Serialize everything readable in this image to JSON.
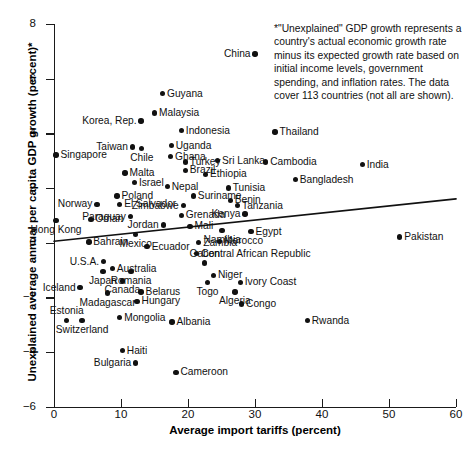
{
  "chart_data": {
    "type": "scatter",
    "title": "",
    "xlabel": "Average import tariffs (percent)",
    "ylabel": "Unexplained average annual per capita GDP growth (percent)*",
    "xlim": [
      0,
      60
    ],
    "ylim": [
      -6,
      8
    ],
    "xticks": [
      0,
      10,
      20,
      30,
      40,
      50,
      60
    ],
    "yticks": [
      -6,
      -4,
      -2,
      0,
      2,
      4,
      6,
      8
    ],
    "grid": false,
    "legend": null,
    "annotation": "*\"Unexplained\" GDP growth represents a country's actual economic growth rate minus its expected growth rate based on initial income levels, government spending, and inflation rates. The data cover 113 countries (not all are shown).",
    "trendline": {
      "x0": 0,
      "y0": 0.05,
      "x1": 60,
      "y1": 1.6
    },
    "points": [
      {
        "name": "China",
        "x": 30.0,
        "y": 6.9,
        "pos": "l"
      },
      {
        "name": "Guyana",
        "x": 16.2,
        "y": 5.45,
        "pos": "r"
      },
      {
        "name": "Malaysia",
        "x": 15.0,
        "y": 4.75,
        "pos": "r"
      },
      {
        "name": "Korea, Rep.",
        "x": 13.0,
        "y": 4.45,
        "pos": "l"
      },
      {
        "name": "Indonesia",
        "x": 19.0,
        "y": 4.1,
        "pos": "r"
      },
      {
        "name": "Thailand",
        "x": 33.0,
        "y": 4.05,
        "pos": "r"
      },
      {
        "name": "Uganda",
        "x": 17.5,
        "y": 3.55,
        "pos": "r"
      },
      {
        "name": "Taiwan",
        "x": 11.7,
        "y": 3.5,
        "pos": "l"
      },
      {
        "name": "Chile",
        "x": 13.1,
        "y": 3.45,
        "pos": "b"
      },
      {
        "name": "Ghana",
        "x": 17.4,
        "y": 3.15,
        "pos": "r"
      },
      {
        "name": "Singapore",
        "x": 0.3,
        "y": 3.2,
        "pos": "r"
      },
      {
        "name": "Sri Lanka",
        "x": 24.4,
        "y": 3.0,
        "pos": "r"
      },
      {
        "name": "Cambodia",
        "x": 31.6,
        "y": 2.95,
        "pos": "r"
      },
      {
        "name": "India",
        "x": 46.0,
        "y": 2.85,
        "pos": "r"
      },
      {
        "name": "Turkey",
        "x": 19.6,
        "y": 2.95,
        "pos": "r"
      },
      {
        "name": "Brazil",
        "x": 19.6,
        "y": 2.65,
        "pos": "r"
      },
      {
        "name": "Malta",
        "x": 10.6,
        "y": 2.55,
        "pos": "r"
      },
      {
        "name": "Ethiopia",
        "x": 22.6,
        "y": 2.5,
        "pos": "r"
      },
      {
        "name": "Bangladesh",
        "x": 36.0,
        "y": 2.3,
        "pos": "r"
      },
      {
        "name": "Israel",
        "x": 12.0,
        "y": 2.2,
        "pos": "r"
      },
      {
        "name": "Nepal",
        "x": 16.9,
        "y": 2.05,
        "pos": "r"
      },
      {
        "name": "Tunisia",
        "x": 26.0,
        "y": 2.0,
        "pos": "r"
      },
      {
        "name": "Suriname",
        "x": 20.8,
        "y": 1.7,
        "pos": "r"
      },
      {
        "name": "Benin",
        "x": 26.3,
        "y": 1.55,
        "pos": "r"
      },
      {
        "name": "Poland",
        "x": 9.4,
        "y": 1.7,
        "pos": "r"
      },
      {
        "name": "Norway",
        "x": 6.4,
        "y": 1.4,
        "pos": "l"
      },
      {
        "name": "El Salvador",
        "x": 9.8,
        "y": 1.4,
        "pos": "r"
      },
      {
        "name": "Zimbabwe",
        "x": 19.3,
        "y": 1.35,
        "pos": "l"
      },
      {
        "name": "Tanzania",
        "x": 27.4,
        "y": 1.35,
        "pos": "r"
      },
      {
        "name": "Grenada",
        "x": 19.0,
        "y": 1.0,
        "pos": "r"
      },
      {
        "name": "Kenya",
        "x": 28.5,
        "y": 1.05,
        "pos": "l"
      },
      {
        "name": "Paraguay",
        "x": 11.4,
        "y": 0.95,
        "pos": "l"
      },
      {
        "name": "Oman",
        "x": 5.5,
        "y": 0.85,
        "pos": "r"
      },
      {
        "name": "Hong Kong",
        "x": 0.3,
        "y": 0.8,
        "pos": "b"
      },
      {
        "name": "Jordan",
        "x": 16.3,
        "y": 0.65,
        "pos": "l"
      },
      {
        "name": "Mali",
        "x": 20.3,
        "y": 0.6,
        "pos": "r"
      },
      {
        "name": "Namibia",
        "x": 25.1,
        "y": 0.45,
        "pos": "b"
      },
      {
        "name": "Egypt",
        "x": 29.4,
        "y": 0.4,
        "pos": "r"
      },
      {
        "name": "Mexico",
        "x": 12.2,
        "y": 0.3,
        "pos": "b"
      },
      {
        "name": "Pakistan",
        "x": 51.6,
        "y": 0.2,
        "pos": "r"
      },
      {
        "name": "Bahrain",
        "x": 5.2,
        "y": 0.02,
        "pos": "r"
      },
      {
        "name": "Zambia",
        "x": 21.6,
        "y": 0.0,
        "pos": "r"
      },
      {
        "name": "Morocco",
        "x": 24.7,
        "y": 0.05,
        "pos": "r"
      },
      {
        "name": "Ecuador",
        "x": 13.9,
        "y": -0.15,
        "pos": "r"
      },
      {
        "name": "Central African Republic",
        "x": 21.3,
        "y": -0.4,
        "pos": "r"
      },
      {
        "name": "U.S.A.",
        "x": 7.4,
        "y": -0.7,
        "pos": "l"
      },
      {
        "name": "Gabon",
        "x": 22.5,
        "y": -0.75,
        "pos": "t"
      },
      {
        "name": "Australia",
        "x": 8.7,
        "y": -0.95,
        "pos": "r"
      },
      {
        "name": "Japan",
        "x": 7.3,
        "y": -1.05,
        "pos": "b"
      },
      {
        "name": "Romania",
        "x": 11.5,
        "y": -1.05,
        "pos": "b"
      },
      {
        "name": "Niger",
        "x": 23.8,
        "y": -1.2,
        "pos": "r"
      },
      {
        "name": "Togo",
        "x": 22.9,
        "y": -1.45,
        "pos": "b"
      },
      {
        "name": "Canada",
        "x": 10.2,
        "y": -1.4,
        "pos": "b"
      },
      {
        "name": "Ivory Coast",
        "x": 27.8,
        "y": -1.45,
        "pos": "r"
      },
      {
        "name": "Iceland",
        "x": 3.9,
        "y": -1.65,
        "pos": "l"
      },
      {
        "name": "Belarus",
        "x": 13.0,
        "y": -1.8,
        "pos": "r"
      },
      {
        "name": "Madagascar",
        "x": 8.0,
        "y": -1.85,
        "pos": "b"
      },
      {
        "name": "Algeria",
        "x": 27.0,
        "y": -1.8,
        "pos": "b"
      },
      {
        "name": "Hungary",
        "x": 12.4,
        "y": -2.15,
        "pos": "r"
      },
      {
        "name": "Congo",
        "x": 28.0,
        "y": -2.25,
        "pos": "r"
      },
      {
        "name": "Estonia",
        "x": 1.9,
        "y": -2.85,
        "pos": "t"
      },
      {
        "name": "Switzerland",
        "x": 4.2,
        "y": -2.85,
        "pos": "b"
      },
      {
        "name": "Mongolia",
        "x": 9.8,
        "y": -2.75,
        "pos": "r"
      },
      {
        "name": "Albania",
        "x": 17.6,
        "y": -2.9,
        "pos": "r"
      },
      {
        "name": "Rwanda",
        "x": 37.8,
        "y": -2.85,
        "pos": "r"
      },
      {
        "name": "Haiti",
        "x": 10.2,
        "y": -3.95,
        "pos": "r"
      },
      {
        "name": "Bulgaria",
        "x": 12.2,
        "y": -4.4,
        "pos": "l"
      },
      {
        "name": "Cameroon",
        "x": 18.2,
        "y": -4.75,
        "pos": "r"
      }
    ]
  }
}
